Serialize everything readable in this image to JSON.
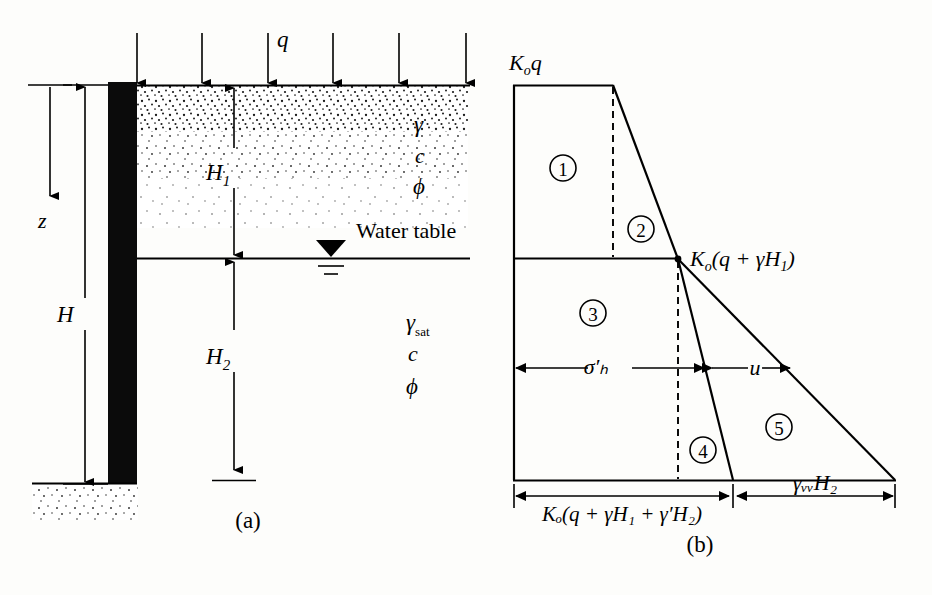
{
  "figure": {
    "caption_a": "(a)",
    "caption_b": "(b)"
  },
  "diagram_a": {
    "name": "retaining-wall-cross-section",
    "surcharge_label": "q",
    "depth_label": "z",
    "total_height_label": "H",
    "layer1_height_label": "H",
    "layer1_height_sub": "1",
    "layer2_height_label": "H",
    "layer2_height_sub": "2",
    "water_table_label": "Water table",
    "upper_soil_props": [
      {
        "symbol": "γ",
        "sub": ""
      },
      {
        "symbol": "c",
        "sub": ""
      },
      {
        "symbol": "ϕ",
        "sub": ""
      }
    ],
    "lower_soil_props": [
      {
        "symbol": "γ",
        "sub": "sat"
      },
      {
        "symbol": "c",
        "sub": ""
      },
      {
        "symbol": "ϕ",
        "sub": ""
      }
    ],
    "surcharge_arrow_count": 6
  },
  "diagram_b": {
    "name": "lateral-earth-pressure-distribution",
    "top_label": "Kₒq",
    "top_label_parts": {
      "k": "K",
      "sub": "o",
      "var": "q"
    },
    "mid_label": "Kₒ(q + γH₁)",
    "mid_label_parts": {
      "k": "K",
      "sub": "o",
      "rest": "(q + γH",
      "h_sub": "1",
      "close": ")"
    },
    "bottom_label_left": "Kₒ(q + γH₁ + γ′H₂)",
    "bottom_label_right": "γᵥᵥH₂",
    "effective_stress_label": "σ′ₕ",
    "pore_pressure_label": "u",
    "regions": [
      {
        "id": "1",
        "label": "①",
        "number": "1"
      },
      {
        "id": "2",
        "label": "②",
        "number": "2"
      },
      {
        "id": "3",
        "label": "③",
        "number": "3"
      },
      {
        "id": "4",
        "label": "④",
        "number": "4"
      },
      {
        "id": "5",
        "label": "⑤",
        "number": "5"
      }
    ]
  },
  "colors": {
    "ink": "#000000",
    "paper": "#fdfdfb",
    "wall_fill": "#0b0b0b"
  }
}
